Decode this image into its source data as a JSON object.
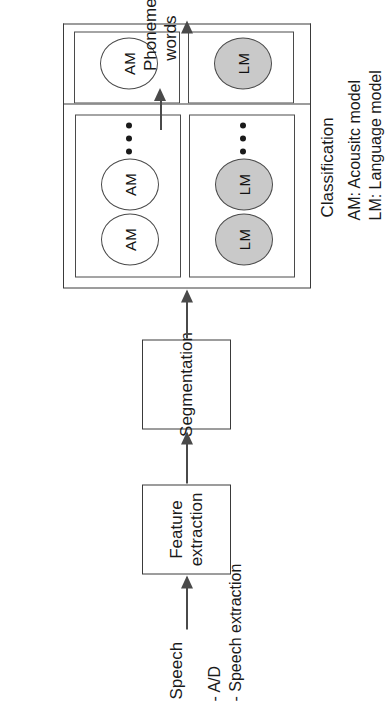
{
  "diagram": {
    "orientation": "rotated-90-ccw",
    "input_label": "Speech",
    "output_label": "Phonemes\nwords",
    "nodes": [
      {
        "id": "feature-extraction",
        "label": "Feature\nextraction"
      },
      {
        "id": "segmentation",
        "label": "Segmentation"
      },
      {
        "id": "classification",
        "label": "Classification"
      }
    ],
    "classification": {
      "group_label": "Classification",
      "rows": [
        {
          "id": "am-row",
          "unit_label": "AM",
          "units_visible": 3,
          "has_ellipsis": true,
          "fill": "#ffffff"
        },
        {
          "id": "lm-row",
          "unit_label": "LM",
          "units_visible": 3,
          "has_ellipsis": true,
          "fill": "#c9c9c9"
        }
      ]
    },
    "preprocessing_note": "- A/D\n- Speech extraction",
    "legend": "AM: Acousitc model\nLM: Language model",
    "ellipsis_glyph": "•••",
    "colors": {
      "stroke": "#3a3a3a",
      "arrow": "#4a4a4a",
      "lm_fill": "#c9c9c9",
      "am_fill": "#ffffff",
      "text": "#1a1a1a",
      "background": "#ffffff"
    }
  }
}
